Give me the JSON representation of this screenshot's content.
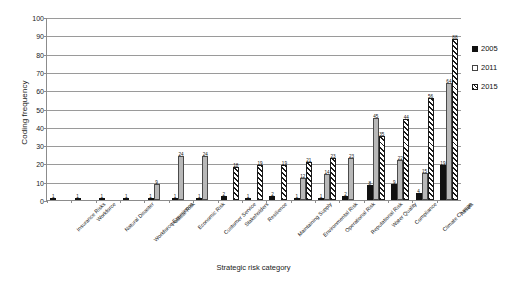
{
  "chart_data": {
    "type": "bar",
    "title": "",
    "xlabel": "Strategic risk category",
    "ylabel": "Coding frequency",
    "ylim": [
      0,
      100
    ],
    "ytick_step": 10,
    "yticks": [
      "0",
      "10",
      "20",
      "30",
      "40",
      "50",
      "60",
      "70",
      "80",
      "90",
      "100"
    ],
    "grid": true,
    "legend_position": "right",
    "categories": [
      "Insurance Risks",
      "Workforce",
      "Natural Disaster",
      "Workforce Experience",
      "Political Risk",
      "Economic Risk",
      "Customer Service",
      "Stakeholders",
      "Resilience",
      "Maintaining Supply",
      "Environmental Risk",
      "Operational Risk",
      "Reputational Risk",
      "Water Quality",
      "Compliance",
      "Climate Change",
      "Assets"
    ],
    "series": [
      {
        "name": "2005",
        "color": "#111111",
        "values": [
          1,
          1,
          1,
          1,
          1,
          1,
          1,
          2,
          1,
          2,
          1,
          1,
          2,
          8,
          9,
          4,
          19
        ],
        "labels": [
          "1",
          "1",
          "1",
          "1",
          "1",
          "1",
          "1",
          "2",
          "1",
          "2",
          "1",
          "1",
          "2",
          "8",
          "9",
          "4",
          "19"
        ]
      },
      {
        "name": "2011",
        "color": "#b8b8b8",
        "values": [
          0,
          0,
          0,
          0,
          9,
          24,
          24,
          0,
          0,
          0,
          12,
          14,
          23,
          45,
          22,
          15,
          64
        ],
        "labels": [
          "",
          "",
          "",
          "",
          "9",
          "24",
          "24",
          "",
          "",
          "",
          "12",
          "14",
          "23",
          "45",
          "22",
          "15",
          "64"
        ]
      },
      {
        "name": "2015",
        "color": "#ffffff",
        "values": [
          0,
          0,
          0,
          0,
          0,
          0,
          0,
          18,
          19,
          19,
          21,
          23,
          0,
          35,
          44,
          56,
          88
        ],
        "labels": [
          "",
          "",
          "",
          "",
          "",
          "",
          "",
          "18",
          "19",
          "19",
          "21",
          "23",
          "",
          "35",
          "44",
          "56",
          "88"
        ]
      }
    ]
  },
  "legend": {
    "items": [
      {
        "label": "2005"
      },
      {
        "label": "2011"
      },
      {
        "label": "2015"
      }
    ]
  }
}
